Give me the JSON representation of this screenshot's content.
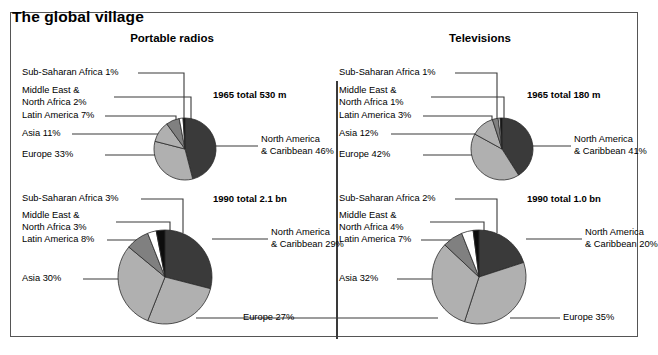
{
  "figure": {
    "title": "The global village",
    "panels": [
      {
        "name": "portable-radios",
        "title": "Portable radios"
      },
      {
        "name": "televisions",
        "title": "Televisions"
      }
    ]
  },
  "colors": {
    "north_america": "#3a3a3a",
    "europe": "#b0b0b0",
    "asia": "#b0b0b0",
    "latin_america": "#808080",
    "middle_east_north_africa": "#ffffff",
    "sub_saharan_africa": "#0d0d0d",
    "frame": "#555555",
    "leader": "#3a3a3a"
  },
  "chart_data": [
    {
      "type": "pie",
      "name": "radios-1965",
      "title": "Portable radios",
      "subtitle": "1965 total 530 m",
      "total_label": "1965 total 530 m",
      "categories": [
        "North America & Caribbean",
        "Europe",
        "Asia",
        "Latin America",
        "Middle East & North Africa",
        "Sub-Saharan Africa"
      ],
      "values": [
        46,
        33,
        11,
        7,
        2,
        1
      ],
      "labels": [
        "North America\n& Caribbean 46%",
        "Europe 33%",
        "Asia 11%",
        "Latin America 7%",
        "Middle East &\nNorth Africa 2%",
        "Sub-Saharan Africa 1%"
      ],
      "unit": "%"
    },
    {
      "type": "pie",
      "name": "radios-1990",
      "title": "Portable radios",
      "subtitle": "1990 total 2.1 bn",
      "total_label": "1990 total 2.1 bn",
      "categories": [
        "North America & Caribbean",
        "Europe",
        "Asia",
        "Latin America",
        "Middle East & North Africa",
        "Sub-Saharan Africa"
      ],
      "values": [
        29,
        27,
        30,
        8,
        3,
        3
      ],
      "labels": [
        "North America\n& Caribbean 29%",
        "Europe 27%",
        "Asia 30%",
        "Latin America 8%",
        "Middle East &\nNorth Africa 3%",
        "Sub-Saharan Africa 3%"
      ],
      "unit": "%"
    },
    {
      "type": "pie",
      "name": "televisions-1965",
      "title": "Televisions",
      "subtitle": "1965 total 180 m",
      "total_label": "1965 total 180 m",
      "categories": [
        "North America & Caribbean",
        "Europe",
        "Asia",
        "Latin America",
        "Middle East & North Africa",
        "Sub-Saharan Africa"
      ],
      "values": [
        41,
        42,
        12,
        3,
        1,
        1
      ],
      "labels": [
        "North America\n& Caribbean 41%",
        "Europe 42%",
        "Asia 12%",
        "Latin America 3%",
        "Middle East &\nNorth Africa 1%",
        "Sub-Saharan Africa 1%"
      ],
      "unit": "%"
    },
    {
      "type": "pie",
      "name": "televisions-1990",
      "title": "Televisions",
      "subtitle": "1990 total 1.0 bn",
      "total_label": "1990 total 1.0 bn",
      "categories": [
        "North America & Caribbean",
        "Europe",
        "Asia",
        "Latin America",
        "Middle East & North Africa",
        "Sub-Saharan Africa"
      ],
      "values": [
        20,
        35,
        32,
        7,
        4,
        2
      ],
      "labels": [
        "North America\n& Caribbean 20%",
        "Europe 35%",
        "Asia 32%",
        "Latin America 7%",
        "Middle East &\nNorth Africa 4%",
        "Sub-Saharan Africa 2%"
      ],
      "unit": "%"
    }
  ],
  "panel_a_1965": {
    "total": "1965 total 530 m",
    "na_line1": "North America",
    "na_line2": "& Caribbean 46%",
    "europe": "Europe 33%",
    "asia": "Asia 11%",
    "latin": "Latin America 7%",
    "mena_line1": "Middle East &",
    "mena_line2": "North Africa 2%",
    "ssa": "Sub-Saharan Africa 1%"
  },
  "panel_a_1990": {
    "total": "1990 total 2.1 bn",
    "na_line1": "North America",
    "na_line2": "& Caribbean 29%",
    "europe": "Europe 27%",
    "asia": "Asia 30%",
    "latin": "Latin America 8%",
    "mena_line1": "Middle East &",
    "mena_line2": "North Africa 3%",
    "ssa": "Sub-Saharan Africa 3%"
  },
  "panel_b_1965": {
    "total": "1965 total 180 m",
    "na_line1": "North America",
    "na_line2": "& Caribbean 41%",
    "europe": "Europe 42%",
    "asia": "Asia 12%",
    "latin": "Latin America 3%",
    "mena_line1": "Middle East &",
    "mena_line2": "North Africa 1%",
    "ssa": "Sub-Saharan Africa 1%"
  },
  "panel_b_1990": {
    "total": "1990 total 1.0 bn",
    "na_line1": "North America",
    "na_line2": "& Caribbean 20%",
    "europe": "Europe 35%",
    "asia": "Asia 32%",
    "latin": "Latin America 7%",
    "mena_line1": "Middle East &",
    "mena_line2": "North Africa 4%",
    "ssa": "Sub-Saharan Africa 2%"
  }
}
